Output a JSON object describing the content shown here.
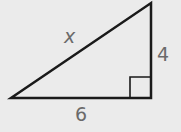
{
  "diagram": {
    "type": "right-triangle",
    "hypotenuse_label": "x",
    "vertical_leg_label": "4",
    "horizontal_leg_label": "6",
    "right_angle_marker": true,
    "colors": {
      "background": "#ebebeb",
      "stroke": "#1a1a1a",
      "label": "#6a6a6a"
    }
  }
}
